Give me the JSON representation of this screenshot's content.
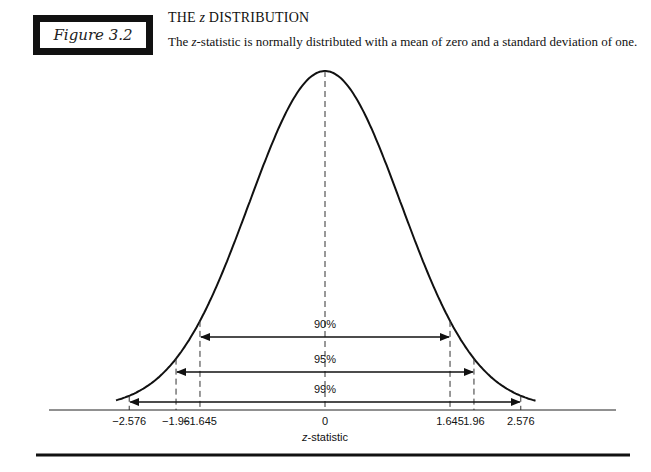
{
  "figure": {
    "label": "Figure 3.2",
    "title_prefix": "THE ",
    "title_var": "z",
    "title_suffix": " DISTRIBUTION",
    "subtitle_prefix": "The ",
    "subtitle_var": "z",
    "subtitle_suffix": "-statistic is normally distributed with a mean of zero and a standard deviation of one."
  },
  "chart_data": {
    "type": "line",
    "title": "THE z DISTRIBUTION",
    "subtitle": "The z-statistic is normally distributed with a mean of zero and a standard deviation of one.",
    "xlabel": "z-statistic",
    "ylabel": "",
    "curve": "standard normal density, mean 0, sd 1",
    "xlim": [
      -2.9,
      3.0
    ],
    "grid": false,
    "x_ticks": [
      -2.576,
      -1.96,
      -1.645,
      0,
      1.645,
      1.96,
      2.576
    ],
    "x_tick_labels": [
      "−2.576",
      "−1.96",
      "−1.645",
      "0",
      "1.645",
      "1.96",
      "2.576"
    ],
    "intervals": [
      {
        "label": "90%",
        "from": -1.645,
        "to": 1.645
      },
      {
        "label": "95%",
        "from": -1.96,
        "to": 1.96
      },
      {
        "label": "99%",
        "from": -2.576,
        "to": 2.576
      }
    ]
  }
}
